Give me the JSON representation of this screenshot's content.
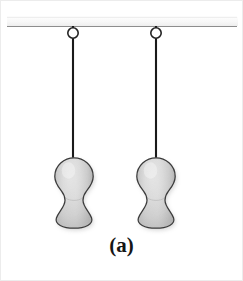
{
  "figure": {
    "caption": "(a)",
    "canvas": {
      "width": 243,
      "height": 281,
      "background": "#ffffff"
    },
    "colors": {
      "background": "#ffffff",
      "border": "#ececec",
      "ceiling_fill_top": "#fbfbfb",
      "ceiling_fill_bottom": "#f0f0f0",
      "ceiling_line": "#8d8d8d",
      "string": "#1a1a1a",
      "ring_stroke": "#232323",
      "ring_fill": "#ffffff",
      "mass_outline": "#3c3c3c",
      "mass_fill_light": "#ededed",
      "mass_fill_mid": "#d2d2d2",
      "mass_fill_dark": "#a9a9a9",
      "mass_shadow": "#bdbdbd"
    },
    "ceiling": {
      "label": "ceiling support bar",
      "x": 6,
      "y": 16,
      "width": 231,
      "height": 9,
      "edge_line_y": 25
    },
    "pendulums": [
      {
        "id": "left",
        "label": "Left pendulum",
        "ring": {
          "cx": 72,
          "cy": 32,
          "r": 5.2,
          "stroke_width": 1.6
        },
        "string": {
          "x": 72,
          "y_top": 25,
          "y_bottom": 158,
          "width": 2.1
        },
        "mass": {
          "label": "peanut-shaped bob",
          "cx": 73,
          "top": 156,
          "bottom": 228,
          "left": 53,
          "right": 93,
          "waist_y": 190,
          "waist_half_width": 13,
          "lobe_half_width": 20
        }
      },
      {
        "id": "right",
        "label": "Right pendulum",
        "ring": {
          "cx": 155,
          "cy": 32,
          "r": 5.2,
          "stroke_width": 1.6
        },
        "string": {
          "x": 155,
          "y_top": 25,
          "y_bottom": 158,
          "width": 2.1
        },
        "mass": {
          "label": "peanut-shaped bob",
          "cx": 155,
          "top": 156,
          "bottom": 228,
          "left": 135,
          "right": 175,
          "waist_y": 190,
          "waist_half_width": 13,
          "lobe_half_width": 20
        }
      }
    ]
  }
}
